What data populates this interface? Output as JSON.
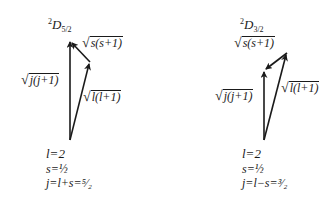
{
  "diagrams": [
    {
      "term_multiplicity": "2",
      "term_letter": "D",
      "term_j": "5/2",
      "labels": {
        "s": "s(s+1)",
        "j": "j(j+1)",
        "l": "l(l+1)"
      },
      "equations": {
        "l": "l=2",
        "s": "s=½",
        "j": "j=l+s=⁵⁄₂"
      }
    },
    {
      "term_multiplicity": "2",
      "term_letter": "D",
      "term_j": "3/2",
      "labels": {
        "s": "s(s+1)",
        "j": "j(j+1)",
        "l": "l(l+1)"
      },
      "equations": {
        "l": "l=2",
        "s": "s=½",
        "j": "j=l−s=³⁄₂"
      }
    }
  ],
  "radical_symbol": "√"
}
